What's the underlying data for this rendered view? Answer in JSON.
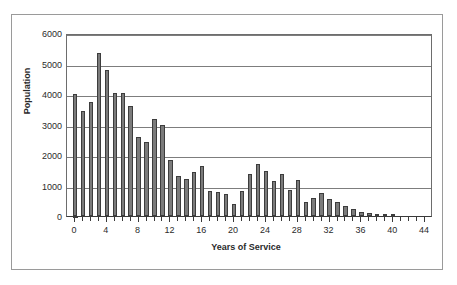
{
  "chart_data": {
    "type": "bar",
    "title": "",
    "xlabel": "Years of Service",
    "ylabel": "Population",
    "xlim": [
      -1,
      45
    ],
    "ylim": [
      0,
      6000
    ],
    "ytick_labels": [
      "6000",
      "5000",
      "4000",
      "3000",
      "2000",
      "1000",
      "0"
    ],
    "yticks": [
      6000,
      5000,
      4000,
      3000,
      2000,
      1000,
      0
    ],
    "xtick_labels": [
      "0",
      "4",
      "8",
      "12",
      "16",
      "20",
      "24",
      "28",
      "32",
      "36",
      "40",
      "44"
    ],
    "xticks": [
      0,
      4,
      8,
      12,
      16,
      20,
      24,
      28,
      32,
      36,
      40,
      44
    ],
    "grid": "horizontal",
    "legend": "none",
    "bar_color": "#7b7b7b",
    "bar_edge_color": "#3d3d3d",
    "categories": [
      0,
      1,
      2,
      3,
      4,
      5,
      6,
      7,
      8,
      9,
      10,
      11,
      12,
      13,
      14,
      15,
      16,
      17,
      18,
      19,
      20,
      21,
      22,
      23,
      24,
      25,
      26,
      27,
      28,
      29,
      30,
      31,
      32,
      33,
      34,
      35,
      36,
      37,
      38,
      39,
      40,
      41,
      42,
      43,
      44
    ],
    "values": [
      4000,
      3450,
      3750,
      5350,
      4780,
      4030,
      4030,
      3620,
      2580,
      2430,
      3180,
      2970,
      1840,
      1300,
      1230,
      1450,
      1650,
      810,
      800,
      710,
      400,
      820,
      1390,
      1690,
      1490,
      1150,
      1390,
      840,
      1170,
      470,
      600,
      760,
      570,
      470,
      320,
      220,
      120,
      90,
      60,
      30,
      20,
      0,
      0,
      0,
      0
    ]
  },
  "axis": {
    "ylabel": "Population",
    "xlabel": "Years of Service"
  }
}
